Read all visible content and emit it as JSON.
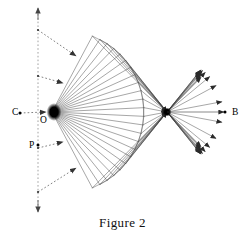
{
  "figure": {
    "caption": "Figure 2",
    "type": "ray-reflection-ellipse-diagram",
    "background_color": "#ffffff",
    "ray_color": "#3a3a3a",
    "dotted_color": "#777777",
    "focus_color": "#000000"
  },
  "labels": {
    "C": "C",
    "O": "O",
    "P": "P",
    "B": "B"
  },
  "points": {
    "C": {
      "label": "C",
      "x": 12,
      "y": 115,
      "dot_x": 20,
      "dot_y": 113
    },
    "O": {
      "label": "O",
      "x": 40,
      "y": 123,
      "dot_x": 52,
      "dot_y": 112
    },
    "P": {
      "label": "P",
      "x": 29,
      "y": 148,
      "dot_x": 38,
      "dot_y": 145
    },
    "B": {
      "label": "B",
      "x": 232,
      "y": 115,
      "dot_x": 225,
      "dot_y": 112
    }
  },
  "geometry": {
    "left_focus": {
      "x": 52,
      "y": 112
    },
    "right_focus": {
      "x": 167,
      "y": 112
    },
    "ray_count": 24,
    "fan_half_angle_deg": 62,
    "outer_radius": 92,
    "directrix_x": 38,
    "directrix_top_y": 8,
    "directrix_bottom_y": 212
  },
  "annotations": {
    "incident_arrows": [
      {
        "from_x": 38,
        "from_y": 30,
        "to_x": 76,
        "to_y": 56
      },
      {
        "from_x": 38,
        "from_y": 76,
        "to_x": 63,
        "to_y": 83
      },
      {
        "from_x": 38,
        "from_y": 148,
        "to_x": 63,
        "to_y": 142
      },
      {
        "from_x": 38,
        "from_y": 192,
        "to_x": 76,
        "to_y": 168
      },
      {
        "from_x": 20,
        "from_y": 113,
        "to_x": 46,
        "to_y": 112
      }
    ],
    "axis_arrow_top": {
      "x": 38,
      "y": 8
    },
    "axis_arrow_bottom": {
      "x": 38,
      "y": 212
    },
    "axis_b_line": {
      "from_x": 167,
      "from_y": 112,
      "to_x": 224,
      "to_y": 112
    }
  }
}
